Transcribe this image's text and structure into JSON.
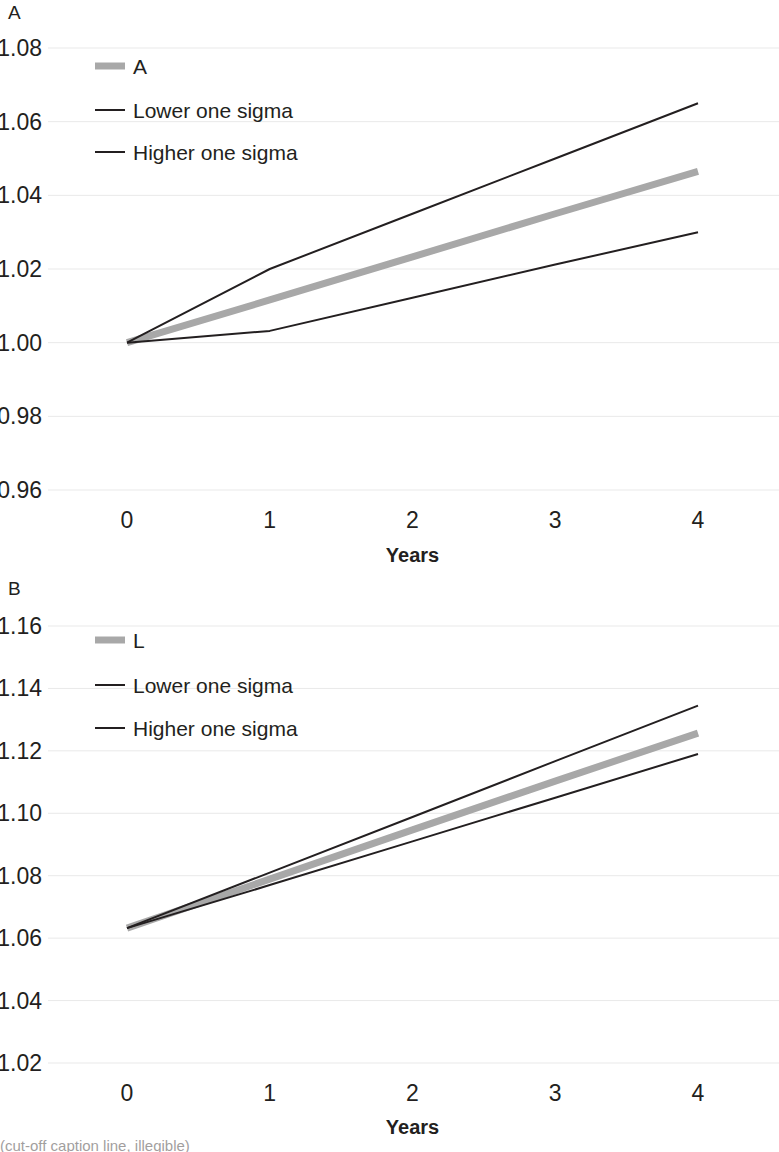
{
  "figure": {
    "panels": [
      "A",
      "B"
    ],
    "background": "#ffffff",
    "text_color": "#231f20",
    "grid_color": "#e9e9e9"
  },
  "panel_a": {
    "letter": "A",
    "xlabel": "Years",
    "ylabel": "",
    "ytick_labels": [
      "1.08",
      "1.06",
      "1.04",
      "1.02",
      "1.00",
      "0.98",
      "0.96"
    ],
    "xtick_labels": [
      "0",
      "1",
      "2",
      "3",
      "4"
    ],
    "legend": [
      {
        "label": "A",
        "color": "#a8a8a8",
        "width": 7
      },
      {
        "label": "Lower one sigma",
        "color": "#231f20",
        "width": 2
      },
      {
        "label": "Higher one sigma",
        "color": "#231f20",
        "width": 2
      }
    ]
  },
  "panel_b": {
    "letter": "B",
    "xlabel": "Years",
    "ylabel": "",
    "ytick_labels": [
      "1.16",
      "1.14",
      "1.12",
      "1.10",
      "1.08",
      "1.06",
      "1.04",
      "1.02"
    ],
    "xtick_labels": [
      "0",
      "1",
      "2",
      "3",
      "4"
    ],
    "legend": [
      {
        "label": "L",
        "color": "#a8a8a8",
        "width": 7
      },
      {
        "label": "Lower one sigma",
        "color": "#231f20",
        "width": 2
      },
      {
        "label": "Higher one sigma",
        "color": "#231f20",
        "width": 2
      }
    ]
  },
  "caption": {
    "text": "(cut-off caption line, illegible)"
  },
  "chart_data": [
    {
      "id": "panel-a",
      "type": "line",
      "title": "A",
      "xlabel": "Years",
      "ylabel": "",
      "x": [
        0,
        1,
        2,
        3,
        4
      ],
      "xlim": [
        0,
        4
      ],
      "ylim": [
        0.96,
        1.08
      ],
      "yticks": [
        1.08,
        1.06,
        1.04,
        1.02,
        1.0,
        0.98,
        0.96
      ],
      "xticks": [
        0,
        1,
        2,
        3,
        4
      ],
      "grid": true,
      "legend_position": "upper-left",
      "series": [
        {
          "name": "A",
          "color": "#a8a8a8",
          "width": 7,
          "values": [
            1.0,
            1.0116,
            1.0233,
            1.035,
            1.0465
          ]
        },
        {
          "name": "Lower one sigma",
          "color": "#231f20",
          "width": 2,
          "values": [
            1.0,
            1.0032,
            1.0122,
            1.0212,
            1.03
          ]
        },
        {
          "name": "Higher one sigma",
          "color": "#231f20",
          "width": 2,
          "values": [
            1.0,
            1.02,
            1.035,
            1.05,
            1.065
          ]
        }
      ]
    },
    {
      "id": "panel-b",
      "type": "line",
      "title": "B",
      "xlabel": "Years",
      "ylabel": "",
      "x": [
        0,
        1,
        2,
        3,
        4
      ],
      "xlim": [
        0,
        4
      ],
      "ylim": [
        1.02,
        1.16
      ],
      "yticks": [
        1.16,
        1.14,
        1.12,
        1.1,
        1.08,
        1.06,
        1.04,
        1.02
      ],
      "xticks": [
        0,
        1,
        2,
        3,
        4
      ],
      "grid": true,
      "legend_position": "upper-left",
      "series": [
        {
          "name": "L",
          "color": "#a8a8a8",
          "width": 7,
          "values": [
            1.0632,
            1.0789,
            1.0947,
            1.1103,
            1.1257
          ]
        },
        {
          "name": "Lower one sigma",
          "color": "#231f20",
          "width": 2,
          "values": [
            1.0632,
            1.077,
            1.091,
            1.105,
            1.119
          ]
        },
        {
          "name": "Higher one sigma",
          "color": "#231f20",
          "width": 2,
          "values": [
            1.0632,
            1.081,
            1.0988,
            1.1167,
            1.1345
          ]
        }
      ]
    }
  ]
}
